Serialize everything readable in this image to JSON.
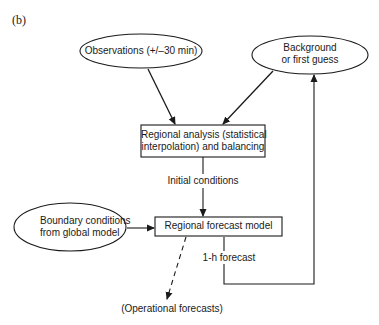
{
  "panel_label": "(b)",
  "nodes": {
    "observations": {
      "label": "Observations (+/–30 min)",
      "shape": "ellipse"
    },
    "background": {
      "line1": "Background",
      "line2": "or first guess",
      "shape": "ellipse"
    },
    "analysis": {
      "line1": "Regional analysis (statistical",
      "line2": "interpolation) and balancing",
      "shape": "rectangle"
    },
    "boundary": {
      "line1": "Boundary conditions",
      "line2": "from global model",
      "shape": "ellipse"
    },
    "forecast_model": {
      "label": "Regional forecast model",
      "shape": "rectangle"
    },
    "operational": {
      "label": "(Operational forecasts)",
      "shape": "text"
    }
  },
  "edges": {
    "initial_conditions": {
      "label": "Initial conditions",
      "from": "analysis",
      "to": "forecast_model"
    },
    "one_hour_forecast": {
      "label": "1-h forecast",
      "from": "forecast_model",
      "to": "background"
    },
    "obs_to_analysis": {
      "from": "observations",
      "to": "analysis"
    },
    "bg_to_analysis": {
      "from": "background",
      "to": "analysis"
    },
    "boundary_to_model": {
      "from": "boundary",
      "to": "forecast_model"
    },
    "model_to_operational": {
      "from": "forecast_model",
      "to": "operational",
      "style": "dashed"
    }
  },
  "colors": {
    "stroke": "#1a1a1a",
    "background": "#ffffff"
  }
}
